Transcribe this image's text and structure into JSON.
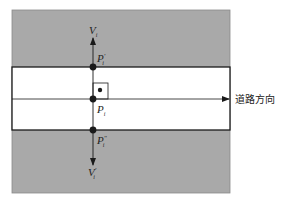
{
  "diagram": {
    "colors": {
      "background": "#ffffff",
      "roadside": "#a9a9a9",
      "road": "#ffffff",
      "line": "#1a1a1a"
    },
    "labels": {
      "v_up": "V",
      "v_up_sub": "i",
      "p_up": "P",
      "p_up_sup": "'",
      "p_up_sub": "i",
      "p_center": "P",
      "p_center_sub": "i",
      "p_down": "P",
      "p_down_sup": "\"",
      "p_down_sub": "i",
      "v_down": "V",
      "v_down_sup": "'",
      "v_down_sub": "i",
      "road_direction": "道路方向"
    }
  }
}
